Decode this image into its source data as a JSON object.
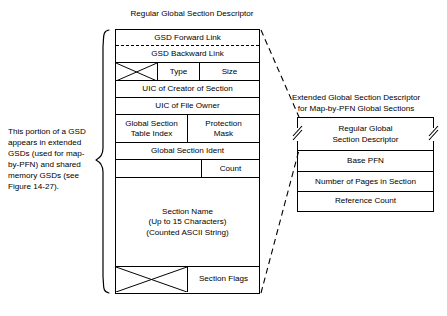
{
  "figure": {
    "regular_title": "Regular Global Section Descriptor",
    "extended_title_line1": "Extended Global Section Descriptor",
    "extended_title_line2": "for Map-by-PFN Global Sections",
    "caption": "This portion of a GSD appears in extended GSDs (used for map-by-PFN) and shared memory GSDs (see Figure 14-27)."
  },
  "regular_gsd": {
    "fields": {
      "forward_link": "GSD Forward Link",
      "backward_link": "GSD Backward Link",
      "type": "Type",
      "size": "Size",
      "uic_creator": "UIC of Creator of Section",
      "uic_owner": "UIC of File Owner",
      "table_index_line1": "Global Section",
      "table_index_line2": "Table Index",
      "protection_line1": "Protection",
      "protection_line2": "Mask",
      "ident": "Global Section Ident",
      "count": "Count",
      "section_name_line1": "Section Name",
      "section_name_line2": "(Up to 15 Characters)",
      "section_name_line3": "(Counted ASCII String)",
      "section_flags": "Section Flags"
    }
  },
  "extended_gsd": {
    "fields": {
      "regular_ref_line1": "Regular Global",
      "regular_ref_line2": "Section Descriptor",
      "base_pfn": "Base PFN",
      "num_pages": "Number of Pages in Section",
      "reference_count": "Reference Count"
    }
  },
  "style": {
    "line_color": "#000000",
    "background": "#ffffff"
  }
}
